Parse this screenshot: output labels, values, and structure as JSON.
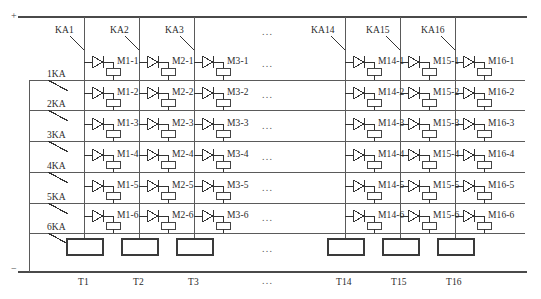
{
  "diagram": {
    "type": "circuit-schematic",
    "polarity": {
      "positive": "+",
      "negative": "−"
    },
    "ellipsis": "...",
    "colors": {
      "wire": "#5a5a5a",
      "symbol": "#333333",
      "text": "#2b2b2b"
    }
  },
  "column_switches": [
    {
      "name": "KA1",
      "x": 84
    },
    {
      "name": "KA2",
      "x": 139
    },
    {
      "name": "KA3",
      "x": 194
    },
    {
      "name": "KA14",
      "x": 345
    },
    {
      "name": "KA15",
      "x": 400
    },
    {
      "name": "KA16",
      "x": 455
    }
  ],
  "row_switches": [
    {
      "name": "1KA",
      "y": 80
    },
    {
      "name": "2KA",
      "y": 110
    },
    {
      "name": "3KA",
      "y": 141
    },
    {
      "name": "4KA",
      "y": 172
    },
    {
      "name": "5KA",
      "y": 203
    },
    {
      "name": "6KA",
      "y": 233
    }
  ],
  "transformers": [
    {
      "name": "T1",
      "x": 84
    },
    {
      "name": "T2",
      "x": 139
    },
    {
      "name": "T3",
      "x": 194
    },
    {
      "name": "T14",
      "x": 345
    },
    {
      "name": "T15",
      "x": 400
    },
    {
      "name": "T16",
      "x": 455
    }
  ],
  "modules": {
    "columns": [
      "M1",
      "M2",
      "M3",
      "M14",
      "M15",
      "M16"
    ],
    "rows": [
      1,
      2,
      3,
      4,
      5,
      6
    ],
    "labels": [
      [
        "M1-1",
        "M2-1",
        "M3-1",
        "M14-1",
        "M15-1",
        "M16-1"
      ],
      [
        "M1-2",
        "M2-2",
        "M3-2",
        "M14-2",
        "M15-2",
        "M16-2"
      ],
      [
        "M1-3",
        "M2-3",
        "M3-3",
        "M14-3",
        "M15-3",
        "M16-3"
      ],
      [
        "M1-4",
        "M2-4",
        "M3-4",
        "M14-4",
        "M15-4",
        "M16-4"
      ],
      [
        "M1-5",
        "M2-5",
        "M3-5",
        "M14-5",
        "M15-5",
        "M16-5"
      ],
      [
        "M1-6",
        "M2-6",
        "M3-6",
        "M14-6",
        "M15-6",
        "M16-6"
      ]
    ]
  },
  "ellipsis_column": {
    "x": 268,
    "rows_y": [
      30,
      62,
      93,
      124,
      155,
      186,
      216,
      247,
      272
    ]
  }
}
